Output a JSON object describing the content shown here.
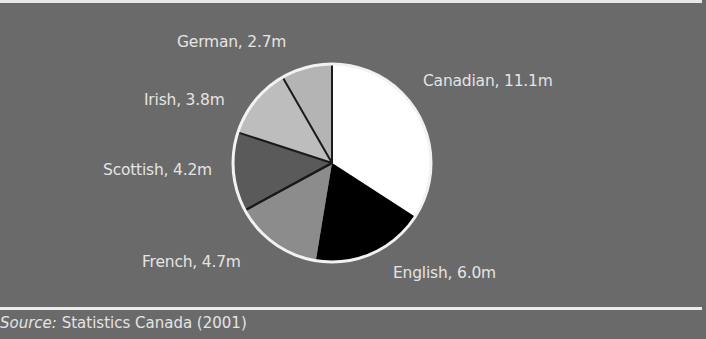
{
  "chart_data": {
    "type": "pie",
    "title": "",
    "categories": [
      "Canadian",
      "English",
      "French",
      "Scottish",
      "Irish",
      "German"
    ],
    "values": [
      11.1,
      6.0,
      4.7,
      4.2,
      3.8,
      2.7
    ],
    "unit": "m",
    "labels": [
      "Canadian, 11.1m",
      "English, 6.0m",
      "French, 4.7m",
      "Scottish, 4.2m",
      "Irish, 3.8m",
      "German, 2.7m"
    ],
    "slice_colors": [
      "#ffffff",
      "#000000",
      "#8c8c8c",
      "#5a5a5a",
      "#bdbdbd",
      "#b4b4b4"
    ],
    "start_angle": "12 o'clock, clockwise",
    "legend": "none (direct labels)"
  },
  "labels": {
    "canadian": "Canadian, 11.1m",
    "english": "English, 6.0m",
    "french": "French, 4.7m",
    "scottish": "Scottish, 4.2m",
    "irish": "Irish, 3.8m",
    "german": "German, 2.7m"
  },
  "source": {
    "prefix": "Source:",
    "text": " Statistics Canada (2001)"
  },
  "colors": {
    "background": "#6a6a6a",
    "text": "#e4e4e4",
    "rule": "#e8e8e8"
  }
}
